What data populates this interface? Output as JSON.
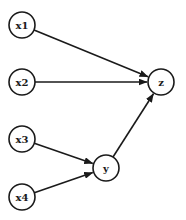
{
  "diagram": {
    "type": "directed-graph",
    "nodes": [
      {
        "id": "x1",
        "label": "x1",
        "cx": 22,
        "cy": 25
      },
      {
        "id": "x2",
        "label": "x2",
        "cx": 22,
        "cy": 82
      },
      {
        "id": "x3",
        "label": "x3",
        "cx": 22,
        "cy": 139
      },
      {
        "id": "x4",
        "label": "x4",
        "cx": 22,
        "cy": 197
      },
      {
        "id": "y",
        "label": "y",
        "cx": 106,
        "cy": 168
      },
      {
        "id": "z",
        "label": "z",
        "cx": 161,
        "cy": 82
      }
    ],
    "edges": [
      {
        "from": "x1",
        "to": "z"
      },
      {
        "from": "x2",
        "to": "z"
      },
      {
        "from": "x3",
        "to": "y"
      },
      {
        "from": "x4",
        "to": "y"
      },
      {
        "from": "y",
        "to": "z"
      }
    ],
    "node_radius": 13
  }
}
